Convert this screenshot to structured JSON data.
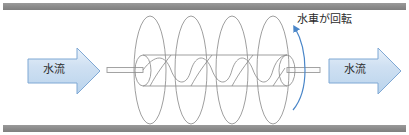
{
  "figure": {
    "background_color": "#ffffff"
  },
  "channel": {
    "wall_color": "#8d8d8d",
    "top_wall_name": "channel-wall-top",
    "bottom_wall_name": "channel-wall-bottom"
  },
  "flow": {
    "left_arrow": {
      "label": "水流",
      "direction": "right",
      "fill_color": "#cfe0f2",
      "stroke_color": "#7fa8d4"
    },
    "right_arrow": {
      "label": "水流",
      "direction": "right",
      "fill_color": "#cfe0f2",
      "stroke_color": "#7fa8d4"
    }
  },
  "rotation": {
    "label": "水車が回転",
    "arrow_color": "#4a86c8",
    "direction": "counter-clockwise-up"
  },
  "screw": {
    "name": "archimedes-screw",
    "line_color": "#8e8e8e",
    "flight_turns": 4,
    "shaft_color": "#9a9a9a"
  }
}
